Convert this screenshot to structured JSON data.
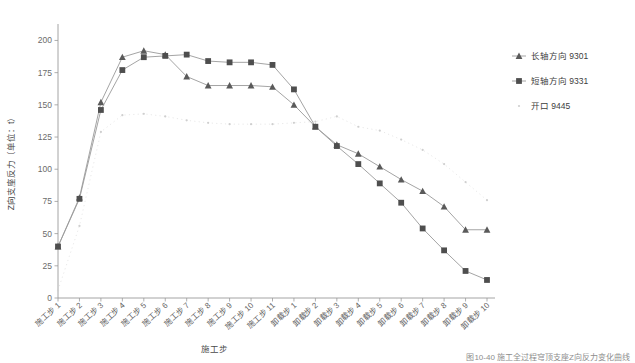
{
  "chart_data": {
    "type": "line",
    "title": "",
    "xlabel": "施工步",
    "ylabel": "Z向支座反力（单位：t）",
    "ylim": [
      0,
      212
    ],
    "yticks": [
      0,
      25,
      50,
      75,
      100,
      125,
      150,
      175,
      200
    ],
    "grid": false,
    "legend_position": "right",
    "categories": [
      "施工步 1",
      "施工步 2",
      "施工步 3",
      "施工步 4",
      "施工步 5",
      "施工步 6",
      "施工步 7",
      "施工步 8",
      "施工步 9",
      "施工步 10",
      "施工步 11",
      "卸载步 1",
      "卸载步 2",
      "卸载步 3",
      "卸载步 4",
      "卸载步 5",
      "卸载步 6",
      "卸载步 7",
      "卸载步 8",
      "卸载步 9",
      "卸载步 10"
    ],
    "series": [
      {
        "name": "长轴方向 9301",
        "marker": "triangle",
        "color": "#5a5a5a",
        "values": [
          40,
          78,
          152,
          187,
          192,
          189,
          172,
          165,
          165,
          165,
          164,
          150,
          133,
          119,
          112,
          102,
          92,
          83,
          71,
          53,
          53
        ]
      },
      {
        "name": "短轴方向 9331",
        "marker": "square",
        "color": "#4e4e4e",
        "values": [
          40,
          77,
          146,
          177,
          187,
          188,
          189,
          184,
          183,
          183,
          181,
          162,
          133,
          118,
          104,
          89,
          74,
          54,
          37,
          21,
          14
        ]
      },
      {
        "name": "开口 9445",
        "marker": "dot",
        "color": "#cfcfcf",
        "values": [
          6,
          56,
          129,
          142,
          143,
          141,
          138,
          136,
          135,
          135,
          135,
          136,
          137,
          141,
          133,
          130,
          123,
          115,
          104,
          90,
          76
        ]
      }
    ]
  },
  "legend": {
    "items": [
      {
        "label": "长轴方向 9301"
      },
      {
        "label": "短轴方向 9331"
      },
      {
        "label": "开口 9445"
      }
    ]
  },
  "caption": {
    "text": "图10-40 施工全过程穹顶支座Z向反力变化曲线"
  }
}
